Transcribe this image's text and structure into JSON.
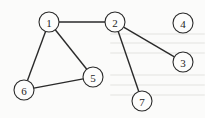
{
  "graph": {
    "type": "undirected",
    "nodes": [
      {
        "id": "1",
        "label": "1",
        "x": 49,
        "y": 22
      },
      {
        "id": "2",
        "label": "2",
        "x": 115,
        "y": 22
      },
      {
        "id": "3",
        "label": "3",
        "x": 183,
        "y": 62
      },
      {
        "id": "4",
        "label": "4",
        "x": 183,
        "y": 23
      },
      {
        "id": "5",
        "label": "5",
        "x": 93,
        "y": 77
      },
      {
        "id": "6",
        "label": "6",
        "x": 24,
        "y": 90
      },
      {
        "id": "7",
        "label": "7",
        "x": 142,
        "y": 101
      }
    ],
    "edges": [
      {
        "from": "1",
        "to": "2"
      },
      {
        "from": "1",
        "to": "6"
      },
      {
        "from": "1",
        "to": "5"
      },
      {
        "from": "6",
        "to": "5"
      },
      {
        "from": "2",
        "to": "3"
      },
      {
        "from": "2",
        "to": "7"
      }
    ],
    "node_radius": 10,
    "colors": {
      "stroke": "#2a2a2a",
      "fill": "#fdfdfc",
      "background": "#fbfbfa"
    }
  }
}
